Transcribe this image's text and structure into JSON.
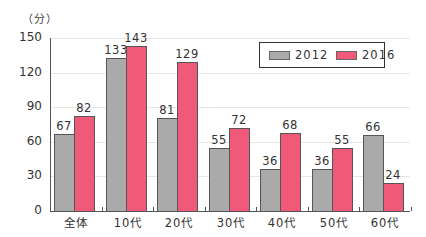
{
  "chart_data": {
    "type": "bar",
    "title": "",
    "unit_label": "（分）",
    "xlabel": "",
    "ylabel": "（分）",
    "ylim": [
      0,
      150
    ],
    "yticks": [
      0,
      30,
      60,
      90,
      120,
      150
    ],
    "grid": true,
    "legend_position": "top-right",
    "categories": [
      "全体",
      "10代",
      "20代",
      "30代",
      "40代",
      "50代",
      "60代"
    ],
    "series": [
      {
        "name": "2012",
        "color": "#aaaaaa",
        "values": [
          67,
          133,
          81,
          55,
          36,
          36,
          66
        ]
      },
      {
        "name": "2016",
        "color": "#f05a78",
        "values": [
          82,
          143,
          129,
          72,
          68,
          55,
          24
        ]
      }
    ]
  }
}
